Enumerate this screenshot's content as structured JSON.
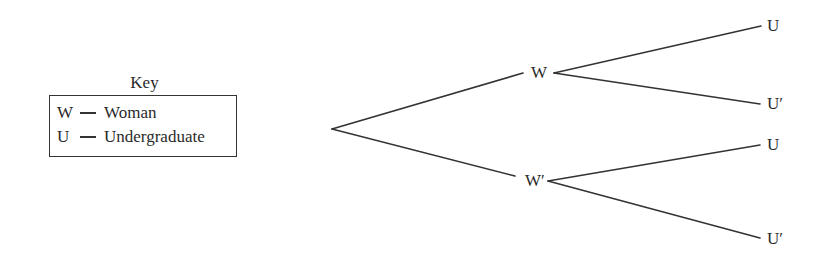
{
  "key": {
    "title": "Key",
    "entries": [
      {
        "symbol": "W",
        "meaning": "Woman"
      },
      {
        "symbol": "U",
        "meaning": "Undergraduate"
      }
    ]
  },
  "tree": {
    "root": {
      "x": 332,
      "y": 129
    },
    "level1": [
      {
        "label": "W",
        "label_x": 531,
        "label_y": 64,
        "in": {
          "x": 523,
          "y": 73
        },
        "out": {
          "x": 554,
          "y": 73
        }
      },
      {
        "label": "W′",
        "label_x": 525,
        "label_y": 172,
        "in": {
          "x": 515,
          "y": 176
        },
        "out": {
          "x": 548,
          "y": 181
        }
      }
    ],
    "leaves": [
      {
        "label": "U",
        "parent": 0,
        "x": 761,
        "y": 26,
        "label_x": 767,
        "label_y": 17
      },
      {
        "label": "U′",
        "parent": 0,
        "x": 760,
        "y": 104,
        "label_x": 767,
        "label_y": 95
      },
      {
        "label": "U",
        "parent": 1,
        "x": 760,
        "y": 145,
        "label_x": 767,
        "label_y": 136
      },
      {
        "label": "U′",
        "parent": 1,
        "x": 760,
        "y": 238,
        "label_x": 767,
        "label_y": 230
      }
    ],
    "line_color": "#333333"
  }
}
